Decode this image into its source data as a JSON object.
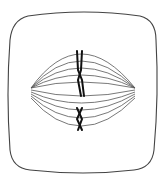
{
  "diagram": {
    "colors": {
      "background": "#ffffff",
      "cell_outline": "#444444",
      "spindle": "#555555",
      "chromosome": "#111111"
    },
    "cell": {
      "left": 8,
      "top": 12,
      "right": 157,
      "bottom": 172
    },
    "spindle": {
      "left_pole": [
        31,
        88
      ],
      "right_pole": [
        135,
        88
      ],
      "fiber_count": 10
    },
    "chromosomes": [
      {
        "id": "upper",
        "x": 80,
        "y_top": 50,
        "y_bottom": 96
      },
      {
        "id": "lower",
        "x": 80,
        "y_top": 107,
        "y_bottom": 130
      }
    ]
  }
}
